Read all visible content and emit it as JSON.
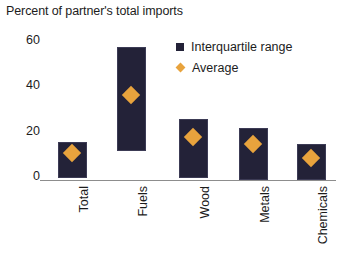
{
  "chart_data": {
    "type": "bar",
    "title": "Percent of partner's total imports",
    "xlabel": "",
    "ylabel": "",
    "ylim": [
      0,
      60
    ],
    "yticks": [
      0,
      20,
      40,
      60
    ],
    "grid": false,
    "legend_position": "top-right",
    "categories": [
      "Total",
      "Fuels",
      "Wood",
      "Metals",
      "Chemicals"
    ],
    "series": [
      {
        "name": "Interquartile range",
        "type": "range-bar",
        "color": "#232238",
        "low": [
          1,
          13,
          1,
          0,
          0
        ],
        "high": [
          17,
          59,
          27,
          23,
          16
        ]
      },
      {
        "name": "Average",
        "type": "marker",
        "marker": "diamond",
        "color": "#e8a33d",
        "values": [
          12,
          38,
          19,
          16,
          10
        ]
      }
    ]
  },
  "legend": {
    "items": [
      {
        "label": "Interquartile range",
        "marker": "square-marker",
        "color": "#232238"
      },
      {
        "label": "Average",
        "marker": "diamond-marker",
        "color": "#e8a33d"
      }
    ]
  },
  "axis": {
    "y_tick_labels": [
      "60",
      "40",
      "20",
      "0"
    ]
  }
}
